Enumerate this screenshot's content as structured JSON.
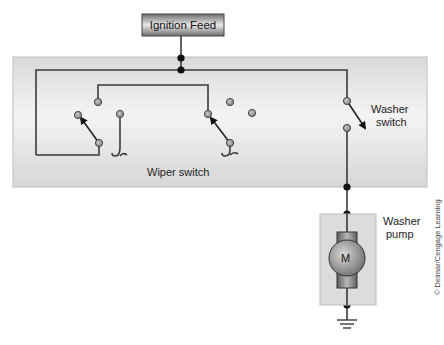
{
  "diagram": {
    "type": "wiring-schematic",
    "ignition_feed": {
      "label": "Ignition Feed"
    },
    "switch_panel": {
      "wiper_switch_label": "Wiper switch",
      "washer_switch_label_line1": "Washer",
      "washer_switch_label_line2": "switch"
    },
    "pump": {
      "label_line1": "Washer",
      "label_line2": "pump",
      "motor_symbol": "M"
    },
    "credit": "© Delmar/Cengage Learning",
    "colors": {
      "panel": "#e3e3e3",
      "wire": "#3a3a3a",
      "node": "#111111",
      "contact_fill": "#9a9a9a",
      "feed_box": "#8c8c8c",
      "motor": "#8a8a8a"
    }
  }
}
